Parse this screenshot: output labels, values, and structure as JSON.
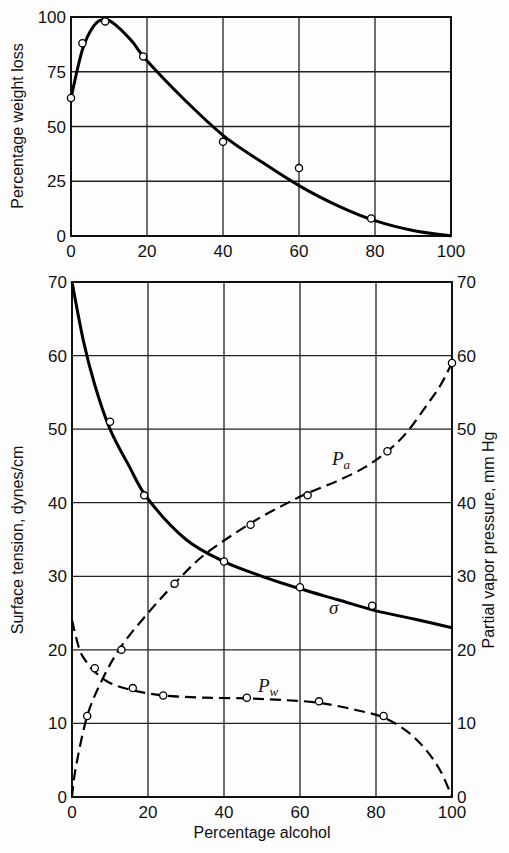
{
  "chart_data": [
    {
      "type": "line",
      "title": "",
      "xlabel": "",
      "ylabel": "Percentage weight loss",
      "xlim": [
        0,
        100
      ],
      "ylim": [
        0,
        100
      ],
      "xticks": [
        0,
        20,
        40,
        60,
        80,
        100
      ],
      "yticks": [
        0,
        25,
        50,
        75,
        100
      ],
      "grid": true,
      "series": [
        {
          "name": "weight loss",
          "style": "solid",
          "points": [
            [
              0,
              63
            ],
            [
              3,
              88
            ],
            [
              9,
              98
            ],
            [
              19,
              82
            ],
            [
              40,
              43
            ],
            [
              60,
              31
            ],
            [
              79,
              8
            ]
          ],
          "curve": [
            [
              0,
              63
            ],
            [
              3,
              85
            ],
            [
              6,
              96
            ],
            [
              9,
              99
            ],
            [
              12,
              96
            ],
            [
              16,
              89
            ],
            [
              20,
              80
            ],
            [
              30,
              62
            ],
            [
              40,
              46
            ],
            [
              50,
              34
            ],
            [
              60,
              23
            ],
            [
              70,
              14
            ],
            [
              80,
              7
            ],
            [
              90,
              2.5
            ],
            [
              100,
              0
            ]
          ]
        }
      ]
    },
    {
      "type": "line",
      "title": "",
      "xlabel": "Percentage alcohol",
      "ylabel": "Surface tension, dynes/cm",
      "ylabel_right": "Partial vapor pressure, mm Hg",
      "xlim": [
        0,
        100
      ],
      "ylim": [
        0,
        70
      ],
      "ylim_right": [
        0,
        70
      ],
      "xticks": [
        0,
        20,
        40,
        60,
        80,
        100
      ],
      "yticks": [
        0,
        10,
        20,
        30,
        40,
        50,
        60,
        70
      ],
      "yticks_right": [
        0,
        10,
        20,
        30,
        40,
        50,
        60,
        70
      ],
      "grid": true,
      "series": [
        {
          "name": "σ",
          "label": "σ",
          "style": "solid",
          "axis": "left",
          "points": [
            [
              10,
              51
            ],
            [
              19,
              41
            ],
            [
              40,
              32
            ],
            [
              60,
              28.5
            ],
            [
              79,
              26
            ]
          ],
          "curve": [
            [
              0,
              70
            ],
            [
              3,
              62
            ],
            [
              6,
              56
            ],
            [
              10,
              50
            ],
            [
              15,
              45
            ],
            [
              20,
              40.5
            ],
            [
              30,
              35
            ],
            [
              40,
              32
            ],
            [
              50,
              30
            ],
            [
              60,
              28.3
            ],
            [
              70,
              26.8
            ],
            [
              80,
              25.3
            ],
            [
              90,
              24.2
            ],
            [
              100,
              23
            ]
          ]
        },
        {
          "name": "P_a",
          "label": "P",
          "label_sub": "a",
          "style": "dashed",
          "axis": "right",
          "points": [
            [
              0,
              0
            ],
            [
              4,
              11
            ],
            [
              13,
              20
            ],
            [
              27,
              29
            ],
            [
              47,
              37
            ],
            [
              62,
              41
            ],
            [
              83,
              47
            ],
            [
              100,
              59
            ]
          ],
          "curve": [
            [
              0,
              0
            ],
            [
              1,
              4
            ],
            [
              4,
              11
            ],
            [
              8,
              16
            ],
            [
              13,
              20.5
            ],
            [
              20,
              25
            ],
            [
              27,
              29
            ],
            [
              35,
              33
            ],
            [
              47,
              37.2
            ],
            [
              55,
              39.5
            ],
            [
              62,
              41.3
            ],
            [
              70,
              43
            ],
            [
              77,
              44.8
            ],
            [
              83,
              47
            ],
            [
              88,
              49.5
            ],
            [
              93,
              53
            ],
            [
              97,
              56
            ],
            [
              100,
              59
            ]
          ]
        },
        {
          "name": "P_w",
          "label": "P",
          "label_sub": "w",
          "style": "dashed",
          "axis": "right",
          "points": [
            [
              0,
              25
            ],
            [
              6,
              17.5
            ],
            [
              16,
              14.8
            ],
            [
              24,
              13.8
            ],
            [
              46,
              13.5
            ],
            [
              65,
              13
            ],
            [
              82,
              11
            ],
            [
              100,
              0
            ]
          ],
          "curve": [
            [
              0,
              24
            ],
            [
              2,
              20
            ],
            [
              4,
              18.2
            ],
            [
              6,
              17
            ],
            [
              10,
              15.5
            ],
            [
              16,
              14.5
            ],
            [
              24,
              13.8
            ],
            [
              35,
              13.5
            ],
            [
              46,
              13.4
            ],
            [
              55,
              13.2
            ],
            [
              65,
              12.8
            ],
            [
              75,
              11.8
            ],
            [
              82,
              10.8
            ],
            [
              88,
              9
            ],
            [
              93,
              6.5
            ],
            [
              97,
              3.5
            ],
            [
              100,
              0
            ]
          ]
        }
      ]
    }
  ],
  "labels": {
    "top_ylabel": "Percentage weight loss",
    "bottom_ylabel_left": "Surface tension, dynes/cm",
    "bottom_ylabel_right": "Partial vapor pressure, mm Hg",
    "bottom_xlabel": "Percentage alcohol",
    "sigma": "σ",
    "pa_main": "P",
    "pa_sub": "a",
    "pw_main": "P",
    "pw_sub": "w"
  }
}
